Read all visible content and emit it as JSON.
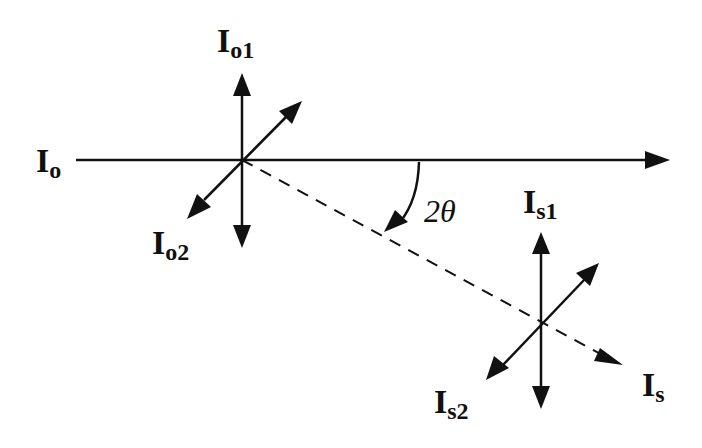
{
  "diagram": {
    "type": "scattering-geometry",
    "colors": {
      "stroke": "#111111",
      "background": "#ffffff"
    },
    "labels": {
      "incident": {
        "main": "I",
        "sub": "o"
      },
      "incident_1": {
        "main": "I",
        "sub": "o1"
      },
      "incident_2": {
        "main": "I",
        "sub": "o2"
      },
      "scattered": {
        "main": "I",
        "sub": "s"
      },
      "scattered_1": {
        "main": "I",
        "sub": "s1"
      },
      "scattered_2": {
        "main": "I",
        "sub": "s2"
      },
      "angle": "2θ"
    }
  }
}
